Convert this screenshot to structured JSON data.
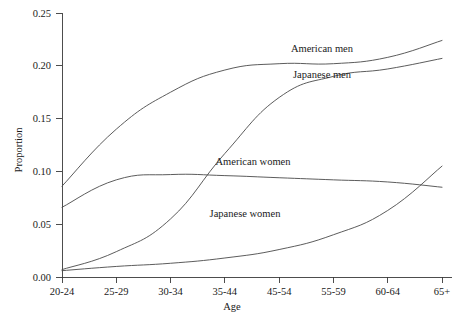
{
  "chart_data": {
    "type": "line",
    "title": "",
    "xlabel": "Age",
    "ylabel": "Proportion",
    "categories": [
      "20-24",
      "25-29",
      "30-34",
      "35-44",
      "45-54",
      "55-59",
      "60-64",
      "65+"
    ],
    "ylim": [
      0.0,
      0.25
    ],
    "ytick_labels": [
      "0.00",
      "0.05",
      "0.10",
      "0.15",
      "0.20",
      "0.25"
    ],
    "ytick_values": [
      0.0,
      0.05,
      0.1,
      0.15,
      0.2,
      0.25
    ],
    "grid": false,
    "legend_position": "inline-annotations",
    "series": [
      {
        "name": "American men",
        "values": [
          0.086,
          0.14,
          0.175,
          0.196,
          0.202,
          0.202,
          0.208,
          0.224
        ],
        "label_x_category": "55-59",
        "color": "#4a4a4a"
      },
      {
        "name": "Japanese men",
        "values": [
          0.007,
          0.024,
          0.055,
          0.117,
          0.17,
          0.19,
          0.197,
          0.207
        ],
        "label_x_category": "55-59",
        "color": "#4a4a4a"
      },
      {
        "name": "American women",
        "values": [
          0.066,
          0.092,
          0.097,
          0.096,
          0.094,
          0.092,
          0.09,
          0.085
        ],
        "label_x_category": "45-54",
        "color": "#4a4a4a"
      },
      {
        "name": "Japanese women",
        "values": [
          0.006,
          0.01,
          0.013,
          0.018,
          0.026,
          0.04,
          0.063,
          0.105
        ],
        "label_x_category": "45-54",
        "color": "#4a4a4a"
      }
    ],
    "annotations": [
      {
        "text": "American men",
        "x": 322,
        "y": 52
      },
      {
        "text": "Japanese men",
        "x": 322,
        "y": 78
      },
      {
        "text": "American women",
        "x": 253,
        "y": 165
      },
      {
        "text": "Japanese women",
        "x": 245,
        "y": 217
      }
    ]
  }
}
